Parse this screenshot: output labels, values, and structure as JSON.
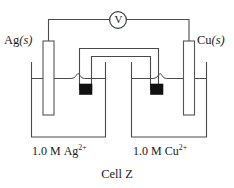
{
  "figure": {
    "caption": "Cell Z",
    "meter": {
      "symbol": "V",
      "name": "voltmeter"
    },
    "left_half_cell": {
      "electrode_label_element": "Ag",
      "electrode_label_state": "(s)",
      "solution_concentration": "1.0 M",
      "solution_species": "Ag",
      "solution_charge": "2+"
    },
    "right_half_cell": {
      "electrode_label_element": "Cu",
      "electrode_label_state": "(s)",
      "solution_concentration": "1.0 M",
      "solution_species": "Cu",
      "solution_charge": "2+"
    },
    "components": {
      "salt_bridge": "salt bridge",
      "left_beaker": "left beaker",
      "right_beaker": "right beaker",
      "left_electrode": "silver electrode",
      "right_electrode": "copper electrode",
      "left_plug": "left salt bridge plug",
      "right_plug": "right salt bridge plug",
      "left_wire": "left connecting wire",
      "right_wire": "right connecting wire",
      "left_surface": "left liquid surface",
      "right_surface": "right liquid surface"
    },
    "colors": {
      "line": "#4a4a4a",
      "plug": "#111111",
      "background": "#ffffff",
      "text": "#1a1a1a"
    }
  }
}
